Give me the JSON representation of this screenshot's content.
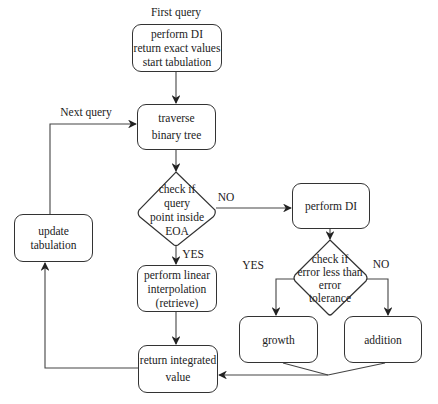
{
  "diagram": {
    "type": "flowchart",
    "colors": {
      "stroke": "#333333",
      "text": "#222222",
      "background": "#ffffff"
    },
    "nodes": {
      "start": {
        "text": "perform DI\nreturn exact values\nstart tabulation",
        "shape": "rounded-rect"
      },
      "traverse": {
        "text": "traverse\nbinary tree",
        "shape": "rounded-rect"
      },
      "check_eoa": {
        "text": "check if\nquery\npoint inside\nEOA",
        "shape": "diamond"
      },
      "linear_interp": {
        "text": "perform linear\ninterpolation\n(retrieve)",
        "shape": "rounded-rect"
      },
      "return_value": {
        "text": "return integrated\nvalue",
        "shape": "rounded-rect"
      },
      "update_tab": {
        "text": "update tabulation",
        "shape": "rounded-rect"
      },
      "perform_di": {
        "text": "perform DI",
        "shape": "rounded-rect"
      },
      "check_error": {
        "text": "check if\nerror less than\nerror\ntolerance",
        "shape": "diamond"
      },
      "growth": {
        "text": "growth",
        "shape": "rounded-rect"
      },
      "addition": {
        "text": "addition",
        "shape": "rounded-rect"
      }
    },
    "labels": {
      "first_query": "First query",
      "next_query": "Next query",
      "eoa_no": "NO",
      "eoa_yes": "YES",
      "error_yes": "YES",
      "error_no": "NO"
    },
    "edges": [
      {
        "from": "first_query",
        "to": "start"
      },
      {
        "from": "start",
        "to": "traverse"
      },
      {
        "from": "traverse",
        "to": "check_eoa"
      },
      {
        "from": "check_eoa",
        "to": "linear_interp",
        "label": "YES"
      },
      {
        "from": "check_eoa",
        "to": "perform_di",
        "label": "NO"
      },
      {
        "from": "linear_interp",
        "to": "return_value"
      },
      {
        "from": "perform_di",
        "to": "check_error"
      },
      {
        "from": "check_error",
        "to": "growth",
        "label": "YES"
      },
      {
        "from": "check_error",
        "to": "addition",
        "label": "NO"
      },
      {
        "from": "growth",
        "to": "return_value"
      },
      {
        "from": "addition",
        "to": "return_value"
      },
      {
        "from": "return_value",
        "to": "update_tab"
      },
      {
        "from": "update_tab",
        "to": "traverse",
        "label": "Next query"
      }
    ]
  }
}
